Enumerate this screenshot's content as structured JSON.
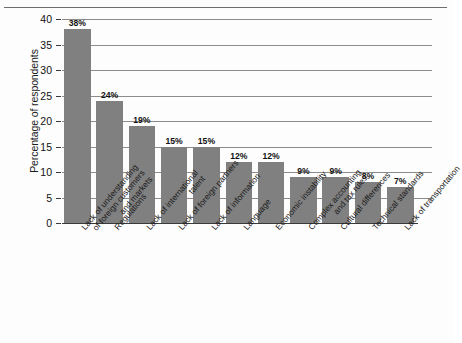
{
  "chart_data": {
    "type": "bar",
    "title": "",
    "subtitle": "",
    "xlabel": "",
    "ylabel": "Percentage of respondents",
    "ylim": [
      0,
      40
    ],
    "yticks": [
      0,
      5,
      10,
      15,
      20,
      25,
      30,
      35,
      40
    ],
    "ytick_labels": [
      "0",
      "5",
      "10",
      "15",
      "20",
      "25",
      "30",
      "35",
      "40"
    ],
    "grid": true,
    "legend": "none",
    "bar_color": "#808080",
    "gridline_color": "#8c8c8c",
    "axis_color": "#3a3a3a",
    "background_color": "#fdfdfd",
    "categories": [
      "Lack of understanding of foreign customers and markets",
      "Regulations",
      "Lack of international talent",
      "Lack of foreign partners",
      "Lack of information",
      "Language",
      "Economic instability",
      "Complex accounting and tax rules",
      "Cultural differences",
      "Technical standards",
      "Lack of transportation"
    ],
    "category_lines": [
      [
        "Lack of understanding",
        "of foreign customers",
        "and markets"
      ],
      [
        "Regulations"
      ],
      [
        "Lack of international",
        "talent"
      ],
      [
        "Lack of foreign partners"
      ],
      [
        "Lack of information"
      ],
      [
        "Language"
      ],
      [
        "Economic instability"
      ],
      [
        "Complex accounting",
        "and tax rules"
      ],
      [
        "Cultural differences"
      ],
      [
        "Technical standards"
      ],
      [
        "Lack of transportation"
      ]
    ],
    "values": [
      38,
      24,
      19,
      15,
      15,
      12,
      12,
      9,
      9,
      8,
      7
    ],
    "data_labels": [
      "38%",
      "24%",
      "19%",
      "15%",
      "15%",
      "12%",
      "12%",
      "9%",
      "9%",
      "8%",
      "7%"
    ]
  }
}
